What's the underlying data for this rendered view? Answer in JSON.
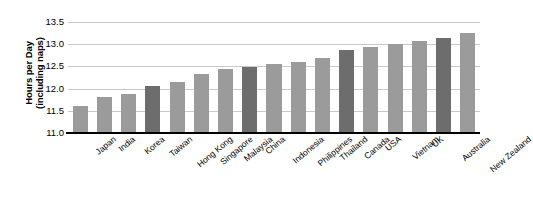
{
  "chart_data": {
    "type": "bar",
    "title": "",
    "subtitle": "",
    "xlabel": "",
    "ylabel": "Hours per Day (including naps)",
    "ylabel_line1": "Hours per Day",
    "ylabel_line2": "(including naps)",
    "ylim": [
      11.0,
      13.5
    ],
    "y_ticks": [
      "11.0",
      "11.5",
      "12.0",
      "12.5",
      "13.0",
      "13.5"
    ],
    "y_tick_values": [
      11.0,
      11.5,
      12.0,
      12.5,
      13.0,
      13.5
    ],
    "grid": true,
    "legend": "none",
    "categories": [
      "Japan",
      "India",
      "Korea",
      "Taiwan",
      "Hong Kong",
      "Singapore",
      "Malaysia",
      "China",
      "Indonesia",
      "Philippines",
      "Thailand",
      "Canada",
      "USA",
      "Vietnam",
      "UK",
      "Australia",
      "New Zealand"
    ],
    "values": [
      11.6,
      11.82,
      11.88,
      12.05,
      12.15,
      12.33,
      12.45,
      12.48,
      12.56,
      12.61,
      12.7,
      12.86,
      12.93,
      13.0,
      13.08,
      13.15,
      13.25
    ],
    "bar_shades": [
      "light",
      "light",
      "light",
      "dark",
      "light",
      "light",
      "light",
      "dark",
      "light",
      "light",
      "light",
      "dark",
      "light",
      "light",
      "light",
      "dark",
      "light"
    ]
  },
  "colors": {
    "bar_light": "#9b9b9b",
    "bar_dark": "#6d6d6d",
    "gridline": "#c9c9c9",
    "axis": "#000000",
    "background": "#ffffff",
    "text": "#000000"
  }
}
